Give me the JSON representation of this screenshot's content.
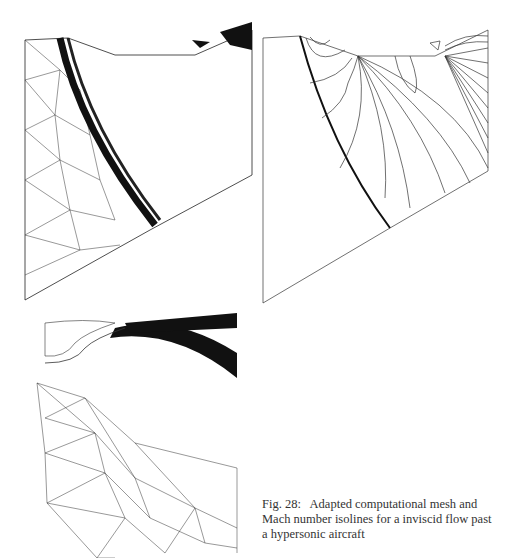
{
  "figure": {
    "number_label": "Fig. 28:",
    "caption_text": "Adapted computational mesh and Mach number isolines for a inviscid flow past a hypersonic aircraft",
    "caption_lines": [
      "Fig. 28:   Adapted computational mesh and",
      "Mach number isolines for a inviscid flow past",
      "a hypersonic aircraft"
    ]
  },
  "panels": [
    {
      "id": "mesh-top",
      "description": "Adapted triangular mesh with refined bow shock band"
    },
    {
      "id": "mach-isolines",
      "description": "Mach number isolines with strong bow shock"
    },
    {
      "id": "mesh-bottom",
      "description": "Adapted mesh near aircraft nose/intake region"
    }
  ]
}
